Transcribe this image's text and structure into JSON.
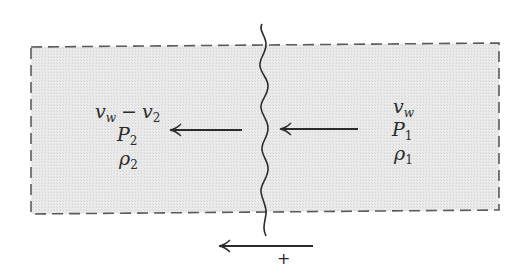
{
  "figure": {
    "type": "shock wave control volume diagram",
    "colors": {
      "region_fill": "#e6e6e6",
      "dash_stroke": "#5a5a5a",
      "line_stroke": "#2b2b2b",
      "background": "#ffffff"
    }
  },
  "region_downstream": {
    "velocity": {
      "v": "v",
      "w": "w",
      "minus": "−",
      "v2": "v",
      "two": "2"
    },
    "pressure": {
      "sym": "P",
      "sub": "2"
    },
    "density": {
      "sym": "ρ",
      "sub": "2"
    }
  },
  "region_upstream": {
    "velocity": {
      "v": "v",
      "w": "w"
    },
    "pressure": {
      "sym": "P",
      "sub": "1"
    },
    "density": {
      "sym": "ρ",
      "sub": "1"
    }
  },
  "direction": {
    "sign": "+"
  }
}
